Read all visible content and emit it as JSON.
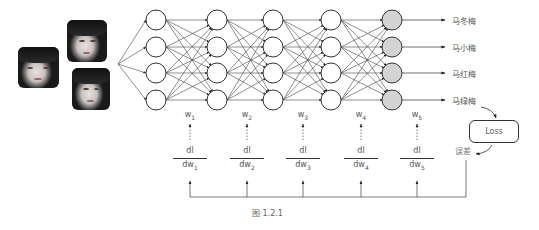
{
  "diagram": {
    "inputs": {
      "photos": [
        {
          "id": "face-photo-1",
          "x": 18,
          "y": 47,
          "w": 41,
          "h": 41
        },
        {
          "id": "face-photo-2",
          "x": 67,
          "y": 20,
          "w": 40,
          "h": 42
        },
        {
          "id": "face-photo-3",
          "x": 72,
          "y": 68,
          "w": 38,
          "h": 42
        }
      ]
    },
    "network": {
      "layers": 5,
      "nodes_per_layer": 4,
      "output_layer_fill": "#d3d3d3",
      "hidden_layer_fill": "#ffffff"
    },
    "outputs": [
      "马冬梅",
      "马小梅",
      "马红梅",
      "马绿梅"
    ],
    "weights": [
      {
        "base": "w",
        "sub": "1"
      },
      {
        "base": "w",
        "sub": "2"
      },
      {
        "base": "w",
        "sub": "3"
      },
      {
        "base": "w",
        "sub": "4"
      },
      {
        "base": "w",
        "sub": "5"
      }
    ],
    "gradients": [
      {
        "num": "dl",
        "den": "dw",
        "sub": "1"
      },
      {
        "num": "dl",
        "den": "dw",
        "sub": "2"
      },
      {
        "num": "dl",
        "den": "dw",
        "sub": "3"
      },
      {
        "num": "dl",
        "den": "dw",
        "sub": "4"
      },
      {
        "num": "dl",
        "den": "dw",
        "sub": "5"
      }
    ],
    "loss_label": "Loss",
    "error_label": "误差",
    "caption": "图 1.2.1"
  }
}
